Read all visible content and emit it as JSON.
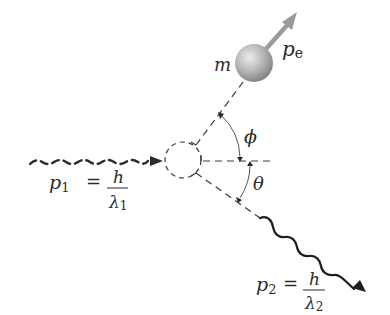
{
  "diagram": {
    "colors": {
      "ink": "#2b2b2b",
      "dash": "#3a3a3a",
      "arc": "#555555",
      "sphere_light": "#e6e6e6",
      "sphere_dark": "#8c8c8c",
      "electron_arrow": "#9a9a9a",
      "background": "#ffffff"
    },
    "electron": {
      "mass_label": "m",
      "momentum_symbol": "p",
      "momentum_subscript": "e"
    },
    "angles": {
      "electron_angle": "ϕ",
      "photon_angle": "θ"
    },
    "incident_photon": {
      "momentum_symbol": "p",
      "momentum_subscript": "1",
      "equals": "=",
      "numerator": "h",
      "denominator_symbol": "λ",
      "denominator_subscript": "1"
    },
    "scattered_photon": {
      "momentum_symbol": "p",
      "momentum_subscript": "2",
      "equals": "=",
      "numerator": "h",
      "denominator_symbol": "λ",
      "denominator_subscript": "2"
    }
  }
}
